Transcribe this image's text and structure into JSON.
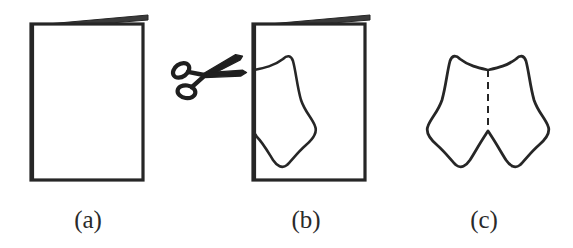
{
  "figure": {
    "kind": "line-drawing",
    "background_color": "#ffffff",
    "ink_color": "#262626",
    "panel_count": 3
  },
  "panels": [
    {
      "id": "a",
      "label": "(a)",
      "name": "folded-sheet",
      "description": "blank sheet of paper folded in half, fold on the left edge",
      "sheet": {
        "left": 31,
        "top": 24,
        "right": 143,
        "bottom": 180,
        "back_edge_label": "back page top edge",
        "back_edge_from_x": 36,
        "back_edge_from_y": 24,
        "back_edge_to_x": 148,
        "back_edge_to_y": 15
      }
    },
    {
      "id": "b",
      "label": "(b)",
      "name": "folded-sheet-with-cut-outline",
      "description": "same folded sheet with a curved cut outline drawn from the fold edge",
      "sheet": {
        "left": 253,
        "top": 24,
        "right": 365,
        "bottom": 180,
        "back_edge_from_x": 258,
        "back_edge_from_y": 24,
        "back_edge_to_x": 370,
        "back_edge_to_y": 15
      },
      "cut_outline": {
        "starts_on_fold_y": 70,
        "ends_on_fold_y": 133,
        "peak_x": 288,
        "peak_y": 57,
        "waist_x": 313,
        "waist_y": 130,
        "bottom_tip_x": 289,
        "bottom_tip_y": 165
      }
    },
    {
      "id": "c",
      "label": "(c)",
      "name": "unfolded-cut-shape",
      "description": "the cut-out piece opened flat, symmetric about a dashed vertical fold line",
      "shape": {
        "center_x": 488,
        "top_y": 57,
        "bottom_y": 165,
        "left_x": 427,
        "right_x": 549,
        "top_notch_y": 70,
        "bottom_notch_y": 131
      },
      "fold_line": {
        "name": "dashed fold crease",
        "x": 488,
        "from_y": 70,
        "to_y": 131,
        "style": "dashed"
      }
    }
  ],
  "scissors": {
    "name": "scissors",
    "label": "scissors cutting tool",
    "center_x": 202,
    "center_y": 76,
    "rotation_deg": -14,
    "blade_direction": "points right, handles on the left",
    "scale": 1.0
  },
  "labels": {
    "a": "(a)",
    "b": "(b)",
    "c": "(c)",
    "a_x": 88,
    "b_x": 306,
    "c_x": 484,
    "baseline_y": 228
  }
}
